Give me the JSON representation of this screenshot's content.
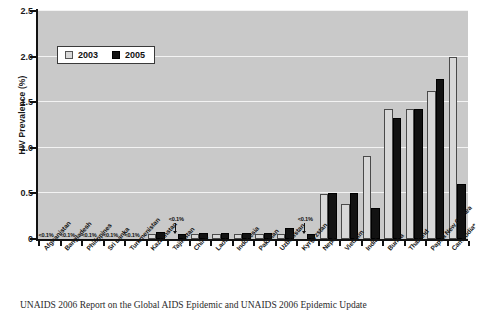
{
  "chart_data": {
    "type": "bar",
    "title": "",
    "subtitle": "",
    "xlabel": "",
    "ylabel": "HIV Prevalence (%)",
    "ylim": [
      0,
      2.5
    ],
    "yticks": [
      0,
      0.5,
      1.0,
      1.5,
      2.0,
      2.5
    ],
    "ytick_labels": [
      "0",
      "0.5",
      "1.0",
      "1.5",
      "2.0",
      "2.5"
    ],
    "grid": true,
    "legend_position": "upper-left",
    "categories": [
      "Afghanistan",
      "Bangladesh",
      "Philippines",
      "Sri Lanka",
      "Turkmenistan",
      "Kazakhstan",
      "Tajikistan",
      "China",
      "Laos",
      "Indonesia",
      "Pakistan",
      "Uzbekistan",
      "Kyrgyzstan",
      "Nepal",
      "Vietnam",
      "India*",
      "Burma",
      "Thailand",
      "Papua New Guinea",
      "Cambodia*"
    ],
    "series": [
      {
        "name": "2003",
        "color": "#d8d8d8",
        "values": [
          0,
          0,
          0,
          0,
          0,
          0.05,
          0,
          0.05,
          0.05,
          0.05,
          0.05,
          0.05,
          0,
          0.49,
          0.38,
          0.91,
          1.43,
          1.43,
          1.62,
          2.0
        ]
      },
      {
        "name": "2005",
        "color": "#121212",
        "values": [
          0,
          0,
          0,
          0,
          0,
          0.08,
          0.06,
          0.07,
          0.07,
          0.07,
          0.07,
          0.12,
          0.06,
          0.5,
          0.5,
          0.34,
          1.33,
          1.43,
          1.75,
          0.6
        ]
      }
    ],
    "annotations": [
      {
        "text": "<0.1%",
        "category": "Afghanistan",
        "arrow": false
      },
      {
        "text": "<0.1%",
        "category": "Bangladesh",
        "arrow": false
      },
      {
        "text": "<0.1%",
        "category": "Philippines",
        "arrow": false
      },
      {
        "text": "<0.1%",
        "category": "Sri Lanka",
        "arrow": false
      },
      {
        "text": "<0.1%",
        "category": "Turkmenistan",
        "arrow": false
      },
      {
        "text": "<0.1%",
        "category": "Tajikistan",
        "arrow": true
      },
      {
        "text": "<0.1%",
        "category": "Kyrgyzstan",
        "arrow": true
      }
    ]
  },
  "legend": {
    "items": [
      {
        "label": "2003",
        "color": "#d8d8d8"
      },
      {
        "label": "2005",
        "color": "#121212"
      }
    ]
  },
  "axis": {
    "y_title": "HIV Prevalence (%)",
    "y_tick_labels": [
      "2.5",
      "2.0",
      "1.5",
      "1.0",
      "0.5",
      "0"
    ]
  },
  "caption": {
    "text": "UNAIDS 2006 Report on the Global AIDS Epidemic and UNAIDS 2006 Epidemic Update"
  },
  "colors": {
    "plot_background": "#c9c9c9",
    "gridline": "#f3f3f3",
    "axis": "#111111",
    "bar_2003": "#d8d8d8",
    "bar_2005": "#121212",
    "page_background": "#ffffff"
  }
}
